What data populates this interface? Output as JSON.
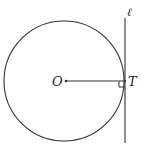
{
  "diagram": {
    "labels": {
      "center": "O",
      "tangent_point": "T",
      "line": "ℓ"
    },
    "colors": {
      "stroke": "#333333",
      "background": "#ffffff"
    },
    "geometry": {
      "circle": {
        "cx": 64,
        "cy": 81,
        "r": 60
      },
      "tangent_line": {
        "x": 125,
        "y1": 18,
        "y2": 143
      },
      "radius_segment": {
        "x1": 66,
        "y1": 81,
        "x2": 125,
        "y2": 81
      },
      "right_angle_marker_size": 5
    }
  }
}
